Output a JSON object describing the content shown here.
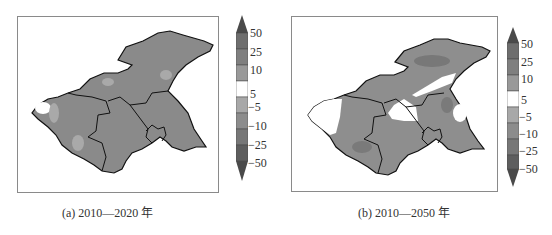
{
  "figure": {
    "panels": [
      {
        "id": "a",
        "caption": "(a) 2010—2020 年",
        "colorbar_ticks": [
          "50",
          "25",
          "10",
          "5",
          "−5",
          "−10",
          "−25",
          "−50"
        ]
      },
      {
        "id": "b",
        "caption": "(b) 2010—2050 年",
        "colorbar_ticks": [
          "50",
          "25",
          "10",
          "5",
          "−5",
          "−10",
          "−25",
          "−50"
        ]
      }
    ],
    "colorbar": {
      "levels": [
        ">50",
        "25~50",
        "10~25",
        "5~10",
        "-5~5",
        "-10~-5",
        "-25~-10",
        "-50~-25",
        "<-50"
      ],
      "colors": [
        "#4a4a4a",
        "#6e6e6e",
        "#8c8c8c",
        "#a8a8a8",
        "#ffffff",
        "#a8a8a8",
        "#8c8c8c",
        "#6e6e6e",
        "#4a4a4a"
      ]
    },
    "colors": {
      "region_dominant_a": "#8a8a8a",
      "region_light": "#a9a9a9",
      "region_dark_b": "#7a7a7a",
      "region_white": "#ffffff",
      "boundary": "#111111",
      "frame": "#8a8a8a"
    }
  }
}
